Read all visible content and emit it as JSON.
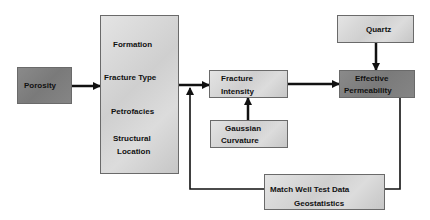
{
  "diagram": {
    "nodes": {
      "porosity": {
        "label": "Porosity"
      },
      "factors": {
        "items": [
          "Formation",
          "Fracture Type",
          "Petrofacies",
          "Structural",
          "Location"
        ]
      },
      "fracture_intensity": {
        "line1": "Fracture",
        "line2": "Intensity"
      },
      "gaussian_curvature": {
        "line1": "Gaussian",
        "line2": "Curvature"
      },
      "quartz": {
        "label": "Quartz"
      },
      "effective_permeability": {
        "line1": "Effective",
        "line2": "Permeability"
      },
      "match_well_test": {
        "line1": "Match Well Test Data",
        "line2": "Geostatistics"
      }
    },
    "edges": [
      {
        "from": "porosity",
        "to": "factors"
      },
      {
        "from": "factors",
        "to": "fracture_intensity"
      },
      {
        "from": "gaussian_curvature",
        "to": "fracture_intensity"
      },
      {
        "from": "fracture_intensity",
        "to": "effective_permeability"
      },
      {
        "from": "quartz",
        "to": "effective_permeability"
      },
      {
        "from": "effective_permeability",
        "to": "match_well_test"
      },
      {
        "from": "match_well_test",
        "to": "fracture_intensity",
        "note": "feedback loop"
      }
    ],
    "colors": {
      "dark_box": "#808080",
      "light_box": "#d6d6d6",
      "line": "#111111"
    }
  }
}
